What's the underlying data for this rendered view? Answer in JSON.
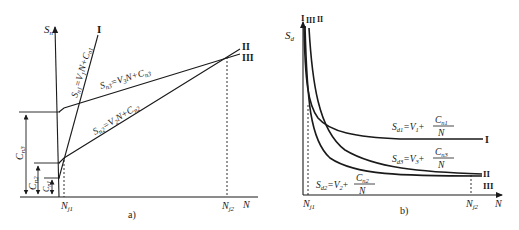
{
  "colors": {
    "ink": "#1a1a1a",
    "background": "#ffffff"
  },
  "panel_a": {
    "caption": "a)",
    "y_axis_label_main": "S",
    "y_axis_label_sub": "n",
    "x_axis_label": "N",
    "n_j1_main": "N",
    "n_j1_sub": "j1",
    "n_j2_main": "N",
    "n_j2_sub": "j2",
    "line_labels": {
      "I": "I",
      "II": "II",
      "III": "III"
    },
    "eq1": {
      "lhs": "S",
      "lhs_sub": "n1",
      "mid": "=V",
      "mid_sub": "1",
      "rest": "N+C",
      "rest_sub": "n1"
    },
    "eq2": {
      "lhs": "S",
      "lhs_sub": "n2",
      "mid": "=V",
      "mid_sub": "2",
      "rest": "N+C",
      "rest_sub": "n2"
    },
    "eq3": {
      "lhs": "S",
      "lhs_sub": "n3",
      "mid": "=V",
      "mid_sub": "3",
      "rest": "N+C",
      "rest_sub": "n3"
    },
    "dims": {
      "c_n1": {
        "main": "C",
        "sub": "n1"
      },
      "c_n2": {
        "main": "C",
        "sub": "n2"
      },
      "c_n3": {
        "main": "C",
        "sub": "n3"
      }
    }
  },
  "panel_b": {
    "caption": "b)",
    "y_axis_label_main": "S",
    "y_axis_label_sub": "d",
    "x_axis_label": "N",
    "n_j1_main": "N",
    "n_j1_sub": "j1",
    "n_j2_main": "N",
    "n_j2_sub": "j2",
    "top_labels": {
      "I": "I",
      "III": "III",
      "II": "II"
    },
    "line_labels": {
      "I": "I",
      "II": "II",
      "III": "III"
    },
    "eq1": {
      "lhs": "S",
      "lhs_sub": "d1",
      "mid": "=V",
      "mid_sub": "1",
      "plus": "+",
      "num": "C",
      "num_sub": "n1",
      "den": "N"
    },
    "eq2": {
      "lhs": "S",
      "lhs_sub": "d2",
      "mid": "=V",
      "mid_sub": "2",
      "plus": "+",
      "num": "C",
      "num_sub": "n2",
      "den": "N"
    },
    "eq3": {
      "lhs": "S",
      "lhs_sub": "d3",
      "mid": "=V",
      "mid_sub": "3",
      "plus": "+",
      "num": "C",
      "num_sub": "n3",
      "den": "N"
    }
  }
}
